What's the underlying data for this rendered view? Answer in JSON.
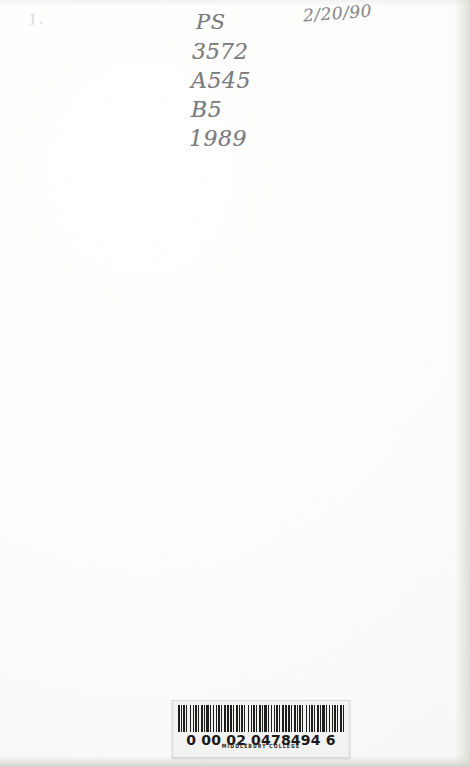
{
  "document": {
    "type": "book-flyleaf-scan",
    "page_width": 470,
    "page_height": 767,
    "paper_color": "#fcfcfb"
  },
  "call_number": {
    "label": "Library of Congress call number",
    "ink_color": "#7c7c80",
    "lines": [
      "PS",
      "3572",
      "A545",
      "B5",
      "1989"
    ]
  },
  "date_stamp": {
    "label": "accession date",
    "text": "2/20/90",
    "ink_color": "#8b8b90"
  },
  "corner_mark": {
    "text": "1.",
    "note": "very faint pencil trace"
  },
  "barcode_label": {
    "institution": "MIDDLEBURY COLLEGE",
    "digit_groups": [
      "0",
      "00",
      "02",
      "0478494",
      "6"
    ],
    "full_number": "0 00 02 0478494 6",
    "label_color": "#f2f2f0",
    "bar_color": "#1d1d1d"
  }
}
